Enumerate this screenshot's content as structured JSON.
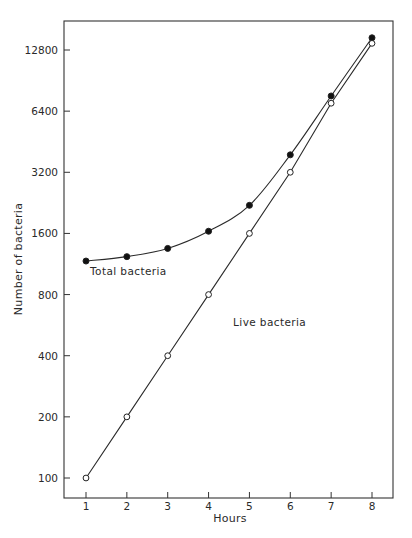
{
  "chart_data": {
    "type": "line",
    "title": "",
    "xlabel": "Hours",
    "ylabel": "Number of bacteria",
    "y_scale": "log2",
    "x": [
      1,
      2,
      3,
      4,
      5,
      6,
      7,
      8
    ],
    "x_ticks": [
      "1",
      "2",
      "3",
      "4",
      "5",
      "6",
      "7",
      "8"
    ],
    "y_ticks": [
      "100",
      "200",
      "400",
      "800",
      "1600",
      "3200",
      "6400",
      "12800"
    ],
    "y_tick_values": [
      100,
      200,
      400,
      800,
      1600,
      3200,
      6400,
      12800
    ],
    "xlim": [
      0.45,
      8.5
    ],
    "ylim": [
      70,
      20000
    ],
    "grid": false,
    "legend": "none (inline labels)",
    "series": [
      {
        "name": "Total bacteria",
        "marker": "filled-circle",
        "values": [
          1170,
          1230,
          1350,
          1640,
          2200,
          3900,
          7600,
          14700
        ],
        "label_position": {
          "x": 1.1,
          "y": 1000
        }
      },
      {
        "name": "Live bacteria",
        "marker": "open-circle",
        "values": [
          100,
          200,
          400,
          800,
          1600,
          3200,
          7000,
          13800
        ],
        "label_position": {
          "x": 4.6,
          "y": 560
        }
      }
    ]
  }
}
